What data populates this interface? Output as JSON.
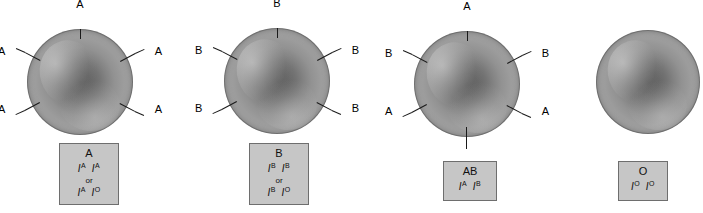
{
  "figure": {
    "background_color": "#ffffff",
    "box_fill_color": "#c6c6c6",
    "box_border_color": "#6e6e6e",
    "cell_color_center": "#5f5f5f",
    "cell_color_rim": "#a3a3a3",
    "marker_color": "#1a1a1a"
  },
  "cells": [
    {
      "id": "blood-type-a",
      "phenotype": "A",
      "genotypes": [
        {
          "allele1_letter": "I",
          "allele1_sup": "A",
          "allele2_letter": "I",
          "allele2_sup": "A"
        },
        {
          "allele1_letter": "I",
          "allele1_sup": "A",
          "allele2_letter": "I",
          "allele2_sup": "O"
        }
      ],
      "or_text": "or",
      "antigens": [
        {
          "label": "A",
          "position": "top"
        },
        {
          "label": "A",
          "position": "upper-left"
        },
        {
          "label": "A",
          "position": "upper-right"
        },
        {
          "label": "A",
          "position": "lower-left"
        },
        {
          "label": "A",
          "position": "lower-right"
        }
      ],
      "antigen_count": 5
    },
    {
      "id": "blood-type-b",
      "phenotype": "B",
      "genotypes": [
        {
          "allele1_letter": "I",
          "allele1_sup": "B",
          "allele2_letter": "I",
          "allele2_sup": "B"
        },
        {
          "allele1_letter": "I",
          "allele1_sup": "B",
          "allele2_letter": "I",
          "allele2_sup": "O"
        }
      ],
      "or_text": "or",
      "antigens": [
        {
          "label": "B",
          "position": "top"
        },
        {
          "label": "B",
          "position": "upper-left"
        },
        {
          "label": "B",
          "position": "upper-right"
        },
        {
          "label": "B",
          "position": "lower-left"
        },
        {
          "label": "B",
          "position": "lower-right"
        }
      ],
      "antigen_count": 5
    },
    {
      "id": "blood-type-ab",
      "phenotype": "AB",
      "genotypes": [
        {
          "allele1_letter": "I",
          "allele1_sup": "A",
          "allele2_letter": "I",
          "allele2_sup": "B"
        }
      ],
      "or_text": "",
      "antigens": [
        {
          "label": "A",
          "position": "top"
        },
        {
          "label": "B",
          "position": "upper-left"
        },
        {
          "label": "B",
          "position": "upper-right"
        },
        {
          "label": "A",
          "position": "lower-left"
        },
        {
          "label": "A",
          "position": "lower-right"
        },
        {
          "label": "B",
          "position": "bottom"
        }
      ],
      "antigen_count": 6
    },
    {
      "id": "blood-type-o",
      "phenotype": "O",
      "genotypes": [
        {
          "allele1_letter": "I",
          "allele1_sup": "O",
          "allele2_letter": "I",
          "allele2_sup": "O"
        }
      ],
      "or_text": "",
      "antigens": [],
      "antigen_count": 0
    }
  ]
}
